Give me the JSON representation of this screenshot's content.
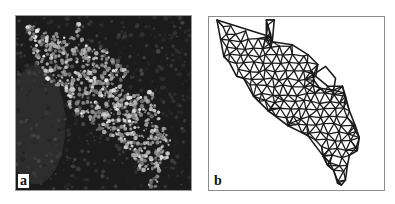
{
  "figure": {
    "panels": [
      {
        "id": "a",
        "label": "a",
        "kind": "grayscale-micrograph",
        "description": "Bright textured tissue region on dark background",
        "colors": {
          "background": "#1b1b1b",
          "foreground": "#e8e8e8"
        }
      },
      {
        "id": "b",
        "label": "b",
        "kind": "triangular-mesh",
        "description": "Triangulated mesh of the segmented region with an interior hole",
        "colors": {
          "background": "#ffffff",
          "edge": "#1a1a1a"
        }
      }
    ]
  }
}
